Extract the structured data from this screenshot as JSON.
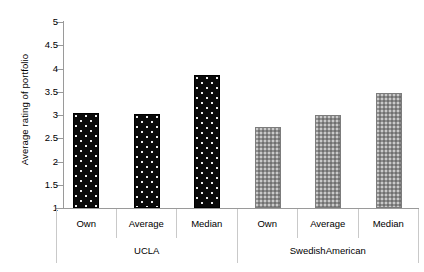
{
  "chart_data": {
    "type": "bar",
    "title": "",
    "xlabel": "",
    "ylabel": "Average rating of portfolio",
    "ylim": [
      1,
      5
    ],
    "yticks": [
      "1",
      "1.5",
      "2",
      "2.5",
      "3",
      "3.5",
      "4",
      "4.5",
      "5"
    ],
    "grid": false,
    "legend": "none",
    "groups": [
      {
        "name": "UCLA",
        "style": "black-dotted",
        "color": "#0a0a0a",
        "categories": [
          "Own",
          "Average",
          "Median"
        ],
        "values": [
          3.05,
          3.03,
          3.85
        ]
      },
      {
        "name": "SwedishAmerican",
        "style": "gray-checkered",
        "color": "#8e8e8e",
        "categories": [
          "Own",
          "Average",
          "Median"
        ],
        "values": [
          2.75,
          3.0,
          3.47
        ]
      }
    ],
    "categories": [
      "Own",
      "Average",
      "Median",
      "Own",
      "Average",
      "Median"
    ],
    "values": [
      3.05,
      3.03,
      3.85,
      2.75,
      3.0,
      3.47
    ]
  },
  "axis": {
    "y_label": "Average rating of portfolio",
    "tick_0": "1",
    "tick_1": "1.5",
    "tick_2": "2",
    "tick_3": "2.5",
    "tick_4": "3",
    "tick_5": "3.5",
    "tick_6": "4",
    "tick_7": "4.5",
    "tick_8": "5"
  },
  "xaxis": {
    "cells": [
      {
        "label": "Own"
      },
      {
        "label": "Average"
      },
      {
        "label": "Median"
      },
      {
        "label": "Own"
      },
      {
        "label": "Average"
      },
      {
        "label": "Median"
      }
    ],
    "groups": [
      {
        "label": "UCLA"
      },
      {
        "label": "SwedishAmerican"
      }
    ]
  }
}
